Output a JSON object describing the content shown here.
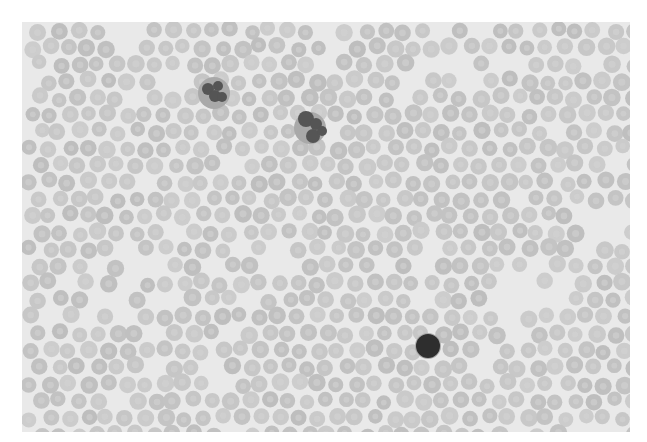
{
  "image": {
    "subject": "peripheral blood smear micrograph (grayscale)",
    "frame": {
      "x": 22,
      "y": 22,
      "width": 608,
      "height": 410
    },
    "colors": {
      "page_background": "#ffffff",
      "smear_background": "#e9e9e9",
      "erythrocyte_fill": "#c5c5c5",
      "erythrocyte_center": "#d3d3d3",
      "leukocyte_dark": "#2e2e2e",
      "leukocyte_mid": "#555555"
    },
    "erythrocytes": {
      "count_approx": 1100,
      "diameter_px": 17,
      "seed": 7
    },
    "leukocytes": [
      {
        "type": "neutrophil (segmented)",
        "cx": 214,
        "cy": 93,
        "lobes": [
          [
            208,
            89,
            6
          ],
          [
            218,
            86,
            5
          ],
          [
            215,
            96,
            6
          ],
          [
            222,
            97,
            5
          ]
        ]
      },
      {
        "type": "neutrophil (segmented)",
        "cx": 310,
        "cy": 128,
        "lobes": [
          [
            306,
            119,
            8
          ],
          [
            316,
            124,
            6
          ],
          [
            313,
            136,
            7
          ],
          [
            322,
            131,
            5
          ]
        ]
      },
      {
        "type": "lymphocyte",
        "cx": 428,
        "cy": 346,
        "lobes": [
          [
            428,
            346,
            12
          ]
        ]
      }
    ]
  }
}
